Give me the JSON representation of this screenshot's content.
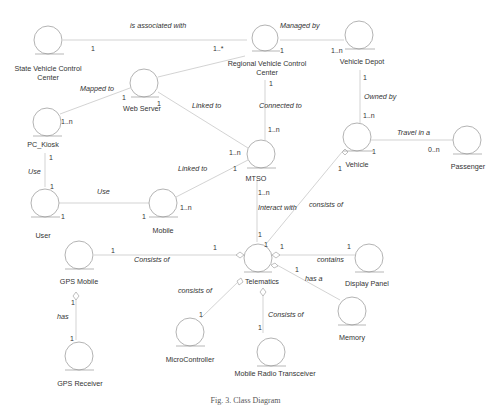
{
  "diagram": {
    "type": "uml-class-diagram",
    "caption": "Fig. 3. Class Diagram",
    "classes": [
      {
        "id": "svcc",
        "label_lines": [
          "State Vehicle Control",
          "Center"
        ],
        "cx": 48,
        "cy": 40
      },
      {
        "id": "rvcc",
        "label_lines": [
          "Regional Vehicle Control",
          "Center"
        ],
        "cx": 265,
        "cy": 38
      },
      {
        "id": "depot",
        "label_lines": [
          "Vehicle Depot"
        ],
        "cx": 359,
        "cy": 35
      },
      {
        "id": "web",
        "label_lines": [
          "Web Server"
        ],
        "cx": 144,
        "cy": 83
      },
      {
        "id": "kiosk",
        "label_lines": [
          "PC_Kiosk"
        ],
        "cx": 47,
        "cy": 122
      },
      {
        "id": "vehicle",
        "label_lines": [
          "Vehicle"
        ],
        "cx": 357,
        "cy": 137
      },
      {
        "id": "passenger",
        "label_lines": [
          "Passenger"
        ],
        "cx": 467,
        "cy": 140
      },
      {
        "id": "mtso",
        "label_lines": [
          "MTSO"
        ],
        "cx": 261,
        "cy": 154
      },
      {
        "id": "user",
        "label_lines": [
          "User"
        ],
        "cx": 45,
        "cy": 203
      },
      {
        "id": "mobile",
        "label_lines": [
          "Mobile"
        ],
        "cx": 163,
        "cy": 203
      },
      {
        "id": "gpsmobile",
        "label_lines": [
          "GPS Mobile"
        ],
        "cx": 79,
        "cy": 255
      },
      {
        "id": "telematics",
        "label_lines": [
          "Telematics"
        ],
        "cx": 258,
        "cy": 258
      },
      {
        "id": "display",
        "label_lines": [
          "Display Panel"
        ],
        "cx": 369,
        "cy": 258
      },
      {
        "id": "memory",
        "label_lines": [
          "Memory"
        ],
        "cx": 352,
        "cy": 311
      },
      {
        "id": "micro",
        "label_lines": [
          "MicroController"
        ],
        "cx": 190,
        "cy": 332
      },
      {
        "id": "radio",
        "label_lines": [
          "Mobile Radio Transceiver"
        ],
        "cx": 271,
        "cy": 352
      },
      {
        "id": "gpsreceiver",
        "label_lines": [
          "GPS Receiver"
        ],
        "cx": 79,
        "cy": 356
      }
    ],
    "associations": [
      {
        "from": "svcc",
        "to": "rvcc",
        "label": "is associated with",
        "from_mult": "1",
        "to_mult": "1..*"
      },
      {
        "from": "rvcc",
        "to": "depot",
        "label": "Managed by",
        "from_mult": "1",
        "to_mult": "1..n"
      },
      {
        "from": "web",
        "to": "rvcc",
        "label": "",
        "from_mult": "",
        "to_mult": ""
      },
      {
        "from": "kiosk",
        "to": "web",
        "label": "Mapped to",
        "from_mult": "1..n",
        "to_mult": "1"
      },
      {
        "from": "web",
        "to": "mtso",
        "label": "Linked to",
        "from_mult": "1",
        "to_mult": "1..n"
      },
      {
        "from": "rvcc",
        "to": "mtso",
        "label": "Connected to",
        "from_mult": "1",
        "to_mult": "1..n"
      },
      {
        "from": "depot",
        "to": "vehicle",
        "label": "Owned by",
        "from_mult": "1",
        "to_mult": "1..n"
      },
      {
        "from": "vehicle",
        "to": "passenger",
        "label": "Travel in a",
        "from_mult": "1",
        "to_mult": "0..n"
      },
      {
        "from": "kiosk",
        "to": "user",
        "label": "Use",
        "from_mult": "1",
        "to_mult": "1"
      },
      {
        "from": "user",
        "to": "mobile",
        "label": "Use",
        "from_mult": "1",
        "to_mult": "1"
      },
      {
        "from": "mobile",
        "to": "mtso",
        "label": "Linked to",
        "from_mult": "1..n",
        "to_mult": "1"
      },
      {
        "from": "mtso",
        "to": "telematics",
        "label": "Interact with",
        "from_mult": "1..n",
        "to_mult": "1"
      },
      {
        "from": "vehicle",
        "to": "telematics",
        "label": "consists of",
        "from_mult": "1",
        "to_mult": "1"
      },
      {
        "from": "gpsmobile",
        "to": "telematics",
        "label": "Consists of",
        "from_mult": "1",
        "to_mult": "1"
      },
      {
        "from": "telematics",
        "to": "display",
        "label": "contains",
        "from_mult": "1",
        "to_mult": "1"
      },
      {
        "from": "telematics",
        "to": "memory",
        "label": "has a",
        "from_mult": "1",
        "to_mult": ""
      },
      {
        "from": "telematics",
        "to": "micro",
        "label": "consists of",
        "from_mult": "",
        "to_mult": "1"
      },
      {
        "from": "telematics",
        "to": "radio",
        "label": "Consists of",
        "from_mult": "",
        "to_mult": "1"
      },
      {
        "from": "gpsmobile",
        "to": "gpsreceiver",
        "label": "has",
        "from_mult": "1",
        "to_mult": "1"
      }
    ]
  },
  "labels": {
    "svcc_1": "State Vehicle Control",
    "svcc_2": "Center",
    "rvcc_1": "Regional Vehicle Control",
    "rvcc_2": "Center",
    "depot": "Vehicle Depot",
    "web": "Web Server",
    "kiosk": "PC_Kiosk",
    "vehicle": "Vehicle",
    "passenger": "Passenger",
    "mtso": "MTSO",
    "user": "User",
    "mobile": "Mobile",
    "gpsmobile": "GPS Mobile",
    "telematics": "Telematics",
    "display": "Display Panel",
    "memory": "Memory",
    "micro": "MicroController",
    "radio": "Mobile Radio Transceiver",
    "gpsreceiver": "GPS Receiver"
  },
  "relations": {
    "assoc": "is associated with",
    "managed": "Managed by",
    "mapped": "Mapped to",
    "linked_web": "Linked to",
    "connected": "Connected to",
    "owned": "Owned by",
    "travel": "Travel in a",
    "use_kiosk": "Use",
    "use_mobile": "Use",
    "linked_mobile": "Linked to",
    "interact": "Interact with",
    "consists_vehicle": "consists of",
    "consists_gps": "Consists of",
    "contains": "contains",
    "hasa": "has a",
    "consists_micro": "consists of",
    "consists_radio": "Consists of",
    "has": "has"
  },
  "mult": {
    "one": "1",
    "one_star": "1..*",
    "one_n": "1..n",
    "zero_n": "0..n"
  },
  "caption": "Fig. 3. Class Diagram"
}
